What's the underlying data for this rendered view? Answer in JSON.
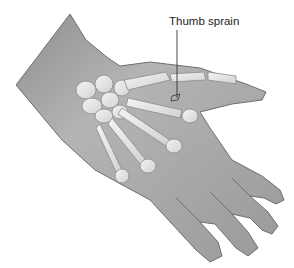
{
  "figure": {
    "colors": {
      "background": "#ffffff",
      "skin": "#9a9a9a",
      "skin_light": "#b8b8b8",
      "skin_outline": "#6e6e6e",
      "bone": "#e8e8e8",
      "bone_outline": "#8a8a8a",
      "leader_line": "#333333",
      "label_text": "#222222"
    }
  },
  "annotations": [
    {
      "label": "Thumb sprain"
    }
  ]
}
